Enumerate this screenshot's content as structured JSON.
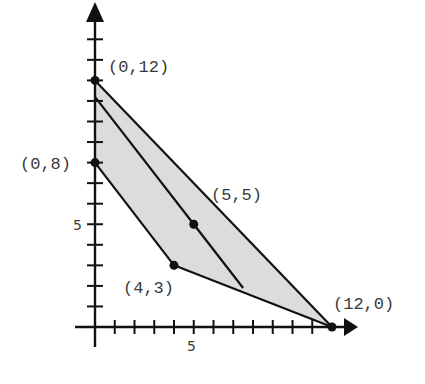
{
  "chart_data": {
    "type": "area",
    "title": "",
    "xlabel": "",
    "ylabel": "",
    "xlim": [
      -1,
      13.2
    ],
    "ylim": [
      -1,
      15.8
    ],
    "grid": false,
    "x_ticks": [
      1,
      2,
      3,
      4,
      5,
      6,
      7,
      8,
      9,
      10,
      11
    ],
    "y_ticks": [
      1,
      2,
      3,
      4,
      5,
      6,
      7,
      8,
      9,
      10,
      11,
      12,
      13,
      14
    ],
    "x_tick_labels": [
      {
        "value": 5,
        "label": "5"
      }
    ],
    "y_tick_labels": [
      {
        "value": 5,
        "label": "5"
      }
    ],
    "feasible_region": {
      "description": "Shaded polygon bounded by two upper/lower boundaries",
      "vertices": [
        [
          0,
          12
        ],
        [
          12,
          0
        ],
        [
          4,
          3
        ],
        [
          0,
          8
        ]
      ],
      "fill": "#dcdcdc"
    },
    "lines": [
      {
        "name": "upper-boundary",
        "points": [
          [
            0,
            12
          ],
          [
            12,
            0
          ]
        ]
      },
      {
        "name": "lower-boundary-left",
        "points": [
          [
            0,
            8
          ],
          [
            4,
            3
          ]
        ]
      },
      {
        "name": "lower-boundary-right",
        "points": [
          [
            4,
            3
          ],
          [
            12,
            0
          ]
        ]
      },
      {
        "name": "objective-line",
        "points": [
          [
            0,
            11.2
          ],
          [
            5,
            5
          ],
          [
            7.5,
            1.9
          ]
        ]
      }
    ],
    "points": [
      {
        "x": 0,
        "y": 12,
        "label": "(0,12)"
      },
      {
        "x": 0,
        "y": 8,
        "label": "(0,8)"
      },
      {
        "x": 5,
        "y": 5,
        "label": "(5,5)"
      },
      {
        "x": 4,
        "y": 3,
        "label": "(4,3)"
      },
      {
        "x": 12,
        "y": 0,
        "label": "(12,0)"
      }
    ]
  },
  "labels": {
    "p_0_12": "(0,12)",
    "p_0_8": "(0,8)",
    "p_5_5": "(5,5)",
    "p_4_3": "(4,3)",
    "p_12_0": "(12,0)",
    "x_tick_5": "5",
    "y_tick_5": "5"
  }
}
